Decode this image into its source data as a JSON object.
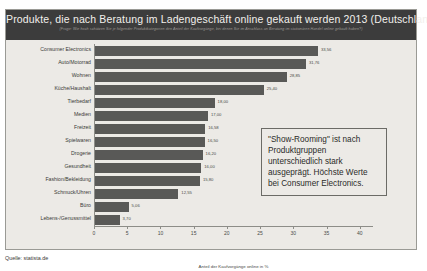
{
  "header": {
    "title": "Produkte, die nach Beratung im Ladengeschäft online gekauft werden 2013 (Deutschland)",
    "subtitle": "(Frage: Wie hoch schätzen Sie je folgender Produktkategorien den Anteil der Kaufvorgänge, bei denen Sie im Anschluss an Beratung im stationären Handel online gekauft haben?)"
  },
  "annotation": {
    "text": "\"Show-Rooming\" ist nach Produktgruppen unterschiedlich stark ausgeprägt. Höchste Werte bei Consumer Electronics."
  },
  "source": {
    "label": "Quelle: statista.de"
  },
  "chart_data": {
    "type": "bar",
    "orientation": "horizontal",
    "title": "Produkte, die nach Beratung im Ladengeschäft online gekauft werden 2013 (Deutschland)",
    "xlabel": "Anteil der Kaufvorgänge online in %",
    "ylabel": "",
    "xlim": [
      0,
      42
    ],
    "xticks": [
      0,
      5,
      10,
      15,
      20,
      25,
      30,
      35,
      40
    ],
    "xtick_labels": [
      "0",
      "5",
      "10",
      "15",
      "20",
      "25",
      "30",
      "35",
      "40"
    ],
    "grid": false,
    "legend": false,
    "bar_color": "#595957",
    "categories": [
      "Consumer Electronics",
      "Auto/Motorrad",
      "Wohnen",
      "Küche/Haushalt",
      "Tierbedarf",
      "Medien",
      "Freizeit",
      "Spielwaren",
      "Drogerie",
      "Gesundheit",
      "Fashion/Bekleidung",
      "Schmuck/Uhren",
      "Büro",
      "Lebens-/Genussmittel"
    ],
    "values": [
      33.56,
      31.76,
      28.85,
      25.4,
      18.0,
      17.0,
      16.58,
      16.5,
      16.2,
      16.0,
      15.8,
      12.55,
      5.06,
      3.7
    ],
    "value_labels": [
      "33,56",
      "31,76",
      "28,85",
      "25,40",
      "18,00",
      "17,00",
      "16,58",
      "16,50",
      "16,20",
      "16,00",
      "15,80",
      "12,55",
      "5,06",
      "3,70"
    ]
  }
}
